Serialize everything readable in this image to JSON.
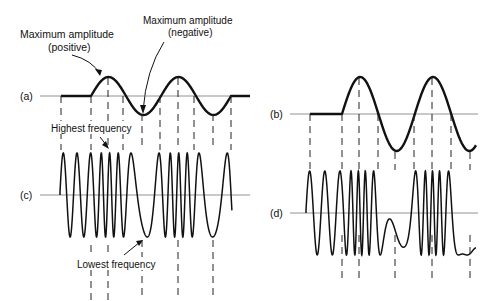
{
  "figure": {
    "labels": {
      "max_pos_line1": "Maximum amplitude",
      "max_pos_line2": "(positive)",
      "max_neg_line1": "Maximum amplitude",
      "max_neg_line2": "(negative)",
      "highest_freq": "Highest frequency",
      "lowest_freq": "Lowest frequency"
    },
    "panels": [
      {
        "id": "a",
        "label": "(a)",
        "type": "modulating-signal-triangular-like"
      },
      {
        "id": "b",
        "label": "(b)",
        "type": "modulating-signal-sine"
      },
      {
        "id": "c",
        "label": "(c)",
        "type": "fm-wave"
      },
      {
        "id": "d",
        "label": "(d)",
        "type": "fm-wave"
      }
    ],
    "colors": {
      "ink": "#111111",
      "axis": "#777777",
      "background": "#ffffff"
    }
  }
}
